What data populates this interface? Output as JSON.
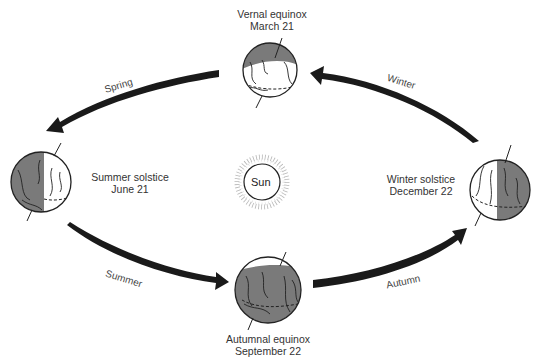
{
  "sun": {
    "label": "Sun"
  },
  "positions": {
    "vernal": {
      "line1": "Vernal equinox",
      "line2": "March 21"
    },
    "summer": {
      "line1": "Summer solstice",
      "line2": "June 21"
    },
    "winter": {
      "line1": "Winter solstice",
      "line2": "December 22"
    },
    "autumnal": {
      "line1": "Autumnal equinox",
      "line2": "September 22"
    }
  },
  "seasons": {
    "spring": "Spring",
    "summer": "Summer",
    "autumn": "Autumn",
    "winter": "Winter"
  },
  "colors": {
    "arrow": "#1a1a1a",
    "shadow": "#7a7a7a",
    "outline": "#222222"
  }
}
